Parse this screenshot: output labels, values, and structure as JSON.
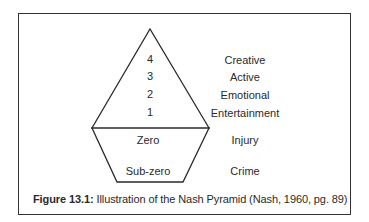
{
  "figure": {
    "caption_label": "Figure 13.1:",
    "caption_text": " Illustration of the Nash Pyramid (Nash, 1960, pg. 89)"
  },
  "pyramid": {
    "levels": [
      {
        "number": "4",
        "label": "Creative"
      },
      {
        "number": "3",
        "label": "Active"
      },
      {
        "number": "2",
        "label": "Emotional"
      },
      {
        "number": "1",
        "label": "Entertainment"
      },
      {
        "number": "Zero",
        "label": "Injury"
      },
      {
        "number": "Sub-zero",
        "label": "Crime"
      }
    ]
  }
}
